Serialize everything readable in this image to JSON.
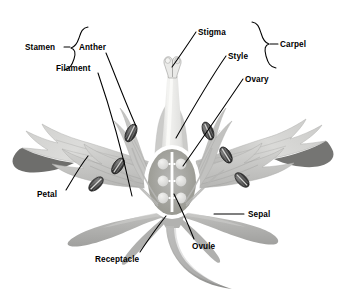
{
  "diagram": {
    "background_color": "#ffffff",
    "label_color": "#000000",
    "leader_color": "#000000"
  },
  "labels": {
    "stamen": "Stamen",
    "anther": "Anther",
    "filament": "Filament",
    "stigma": "Stigma",
    "carpel": "Carpel",
    "style": "Style",
    "ovary": "Ovary",
    "petal": "Petal",
    "sepal": "Sepal",
    "ovule": "Ovule",
    "receptacle": "Receptacle"
  },
  "groups": [
    {
      "name": "stamen",
      "label": "Stamen",
      "members": [
        "Anther",
        "Filament"
      ]
    },
    {
      "name": "carpel",
      "label": "Carpel",
      "members": [
        "Stigma",
        "Style",
        "Ovary"
      ]
    }
  ],
  "parts": [
    {
      "name": "stigma",
      "label": "Stigma",
      "group": "carpel"
    },
    {
      "name": "style",
      "label": "Style",
      "group": "carpel"
    },
    {
      "name": "ovary",
      "label": "Ovary",
      "group": "carpel"
    },
    {
      "name": "ovule",
      "label": "Ovule",
      "group": "carpel",
      "count": 6
    },
    {
      "name": "anther",
      "label": "Anther",
      "group": "stamen",
      "count": 6
    },
    {
      "name": "filament",
      "label": "Filament",
      "group": "stamen"
    },
    {
      "name": "petal",
      "label": "Petal",
      "group": "perianth"
    },
    {
      "name": "sepal",
      "label": "Sepal",
      "group": "perianth"
    },
    {
      "name": "receptacle",
      "label": "Receptacle",
      "group": "axis"
    }
  ],
  "colors": {
    "petal_light": "#d8d8d6",
    "petal_mid": "#bdbdbb",
    "petal_dark": "#9a9a98",
    "petal_tip_dark": "#6e6e6c",
    "sepal": "#b4b4b2",
    "style_pale": "#f0f0ee",
    "anther_dark": "#3c3c3c",
    "ovary_outline": "#ffffff",
    "ovule": "#e4e4e2",
    "stem": "#a8a8a6"
  }
}
